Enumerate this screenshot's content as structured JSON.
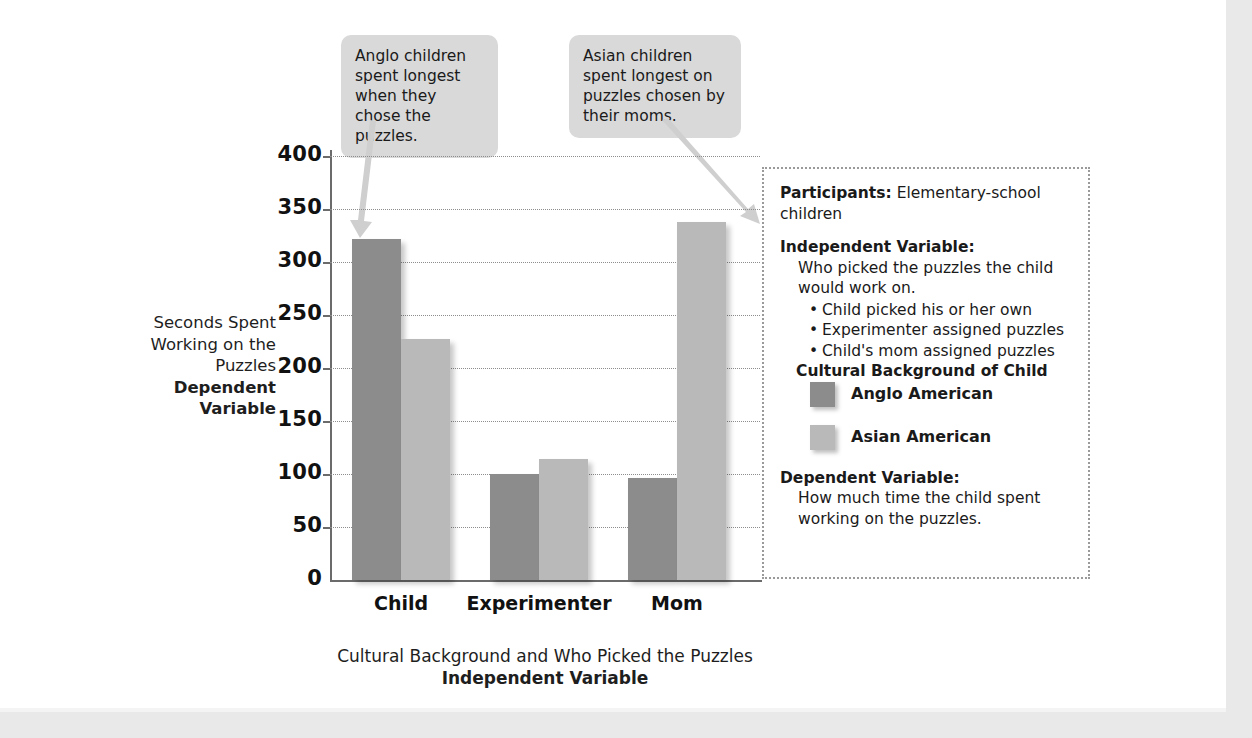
{
  "callouts": [
    {
      "id": "anglo",
      "text": "Anglo children spent longest when they chose the puzzles."
    },
    {
      "id": "asian",
      "text": "Asian children spent longest on puzzles chosen by their moms."
    }
  ],
  "axis": {
    "y_title_regular": "Seconds Spent Working on the Puzzles",
    "y_title_bold": "Dependent Variable",
    "x_title_regular": "Cultural Background and Who Picked the Puzzles",
    "x_title_bold": "Independent Variable"
  },
  "info": {
    "participants_label": "Participants:",
    "participants_value": " Elementary-school children",
    "iv_label": "Independent Variable:",
    "iv_text": "Who picked the puzzles the child would work on.",
    "iv_bullets": [
      "Child picked his or her own",
      "Experimenter assigned puzzles",
      "Child's mom assigned puzzles"
    ],
    "legend_title": "Cultural Background of Child",
    "dv_label": "Dependent Variable:",
    "dv_text": "How much time the child spent working on the puzzles."
  },
  "chart_data": {
    "type": "bar",
    "title": "",
    "categories": [
      "Child",
      "Experimenter",
      "Mom"
    ],
    "series": [
      {
        "name": "Anglo American",
        "color": "#8c8c8c",
        "values": [
          322,
          100,
          96
        ]
      },
      {
        "name": "Asian American",
        "color": "#b9b9b9",
        "values": [
          227,
          114,
          338
        ]
      }
    ],
    "xlabel": "Cultural Background and Who Picked the Puzzles / Independent Variable",
    "ylabel": "Seconds Spent Working on the Puzzles / Dependent Variable",
    "ylim": [
      0,
      400
    ],
    "yticks": [
      0,
      50,
      100,
      150,
      200,
      250,
      300,
      350,
      400
    ],
    "ytick_labels": [
      "0",
      "50",
      "100",
      "150",
      "200",
      "250",
      "300",
      "350",
      "400"
    ],
    "grid": true,
    "legend_position": "right-panel"
  }
}
